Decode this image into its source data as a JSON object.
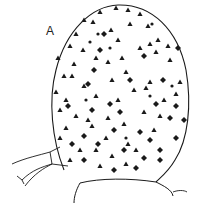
{
  "figure": {
    "panel_label": "A",
    "colors": {
      "ink": "#1a1a1a",
      "background": "#ffffff"
    },
    "marker_types": [
      "triangle-marker",
      "diamond-marker"
    ]
  }
}
